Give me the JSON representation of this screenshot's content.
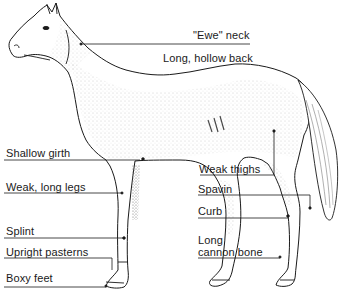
{
  "diagram": {
    "labels": {
      "ewe_neck": "\"Ewe\" neck",
      "long_hollow_back": "Long, hollow back",
      "shallow_girth": "Shallow girth",
      "weak_long_legs": "Weak, long legs",
      "splint": "Splint",
      "upright_pasterns": "Upright pasterns",
      "boxy_feet": "Boxy feet",
      "weak_thighs": "Weak thighs",
      "spavin": "Spavin",
      "curb": "Curb",
      "long_cannon_bone_line1": "Long",
      "long_cannon_bone_line2": "cannon bone"
    },
    "colors": {
      "ink": "#1a1a1a",
      "shade": "#9a9a9a",
      "background": "#ffffff"
    }
  }
}
